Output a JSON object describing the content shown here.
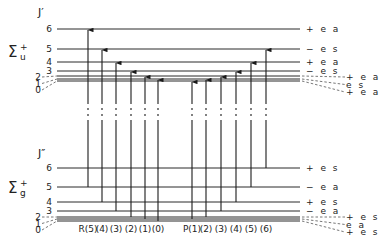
{
  "upper_state": {
    "term_symbol": "Σ",
    "term_sup": "+",
    "term_sub": "u",
    "j_label": "J′",
    "levels": [
      {
        "J": "6",
        "y": 29,
        "parity_label": "+ e a"
      },
      {
        "J": "5",
        "y": 49,
        "parity_label": "− e s"
      },
      {
        "J": "4",
        "y": 62,
        "parity_label": "+ e a"
      },
      {
        "J": "3",
        "y": 71,
        "parity_label": "− e s"
      },
      {
        "J": "2",
        "y": 76,
        "parity_label": "+ e a"
      },
      {
        "J": "1",
        "y": 79,
        "parity_label": "e s"
      },
      {
        "J": "0",
        "y": 81,
        "parity_label": "+ e a"
      }
    ]
  },
  "lower_state": {
    "term_symbol": "Σ",
    "term_sup": "+",
    "term_sub": "g",
    "j_label": "J″",
    "levels": [
      {
        "J": "6",
        "y": 168,
        "parity_label": "+ e s"
      },
      {
        "J": "5",
        "y": 187,
        "parity_label": "− e a"
      },
      {
        "J": "4",
        "y": 202,
        "parity_label": "+ e s"
      },
      {
        "J": "3",
        "y": 211,
        "parity_label": "− e a"
      },
      {
        "J": "2",
        "y": 217,
        "parity_label": "+ e s"
      },
      {
        "J": "1",
        "y": 219,
        "parity_label": "e a"
      },
      {
        "J": "0",
        "y": 221,
        "parity_label": "+ e s"
      }
    ]
  },
  "branches": {
    "R": {
      "label_prefix": "R",
      "transitions": [
        {
          "label": "R(5)",
          "x": 88,
          "lower_J": 5,
          "upper_J": 6
        },
        {
          "label": "(4)",
          "x": 102,
          "lower_J": 4,
          "upper_J": 5
        },
        {
          "label": "(3)",
          "x": 116,
          "lower_J": 3,
          "upper_J": 4
        },
        {
          "label": "(2)",
          "x": 131,
          "lower_J": 2,
          "upper_J": 3
        },
        {
          "label": "(1)",
          "x": 145,
          "lower_J": 1,
          "upper_J": 2
        },
        {
          "label": "(0)",
          "x": 158,
          "lower_J": 0,
          "upper_J": 1
        }
      ]
    },
    "P": {
      "label_prefix": "P",
      "transitions": [
        {
          "label": "P(1)",
          "x": 192,
          "lower_J": 1,
          "upper_J": 0
        },
        {
          "label": "(2)",
          "x": 206,
          "lower_J": 2,
          "upper_J": 1
        },
        {
          "label": "(3)",
          "x": 221,
          "lower_J": 3,
          "upper_J": 2
        },
        {
          "label": "(4)",
          "x": 236,
          "lower_J": 4,
          "upper_J": 3
        },
        {
          "label": "(5)",
          "x": 251,
          "lower_J": 5,
          "upper_J": 4
        },
        {
          "label": "(6)",
          "x": 266,
          "lower_J": 6,
          "upper_J": 5
        }
      ]
    }
  },
  "colors": {
    "line": "#2a2a2a",
    "background": "#ffffff"
  }
}
